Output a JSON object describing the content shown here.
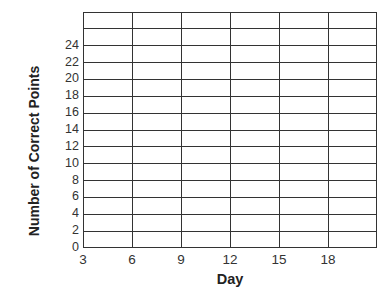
{
  "chart_data": {
    "type": "line",
    "title": "",
    "xlabel": "Day",
    "ylabel": "Number of Correct Points",
    "x_ticks": [
      "3",
      "6",
      "9",
      "12",
      "15",
      "18"
    ],
    "y_ticks": [
      "0",
      "2",
      "4",
      "6",
      "8",
      "10",
      "12",
      "14",
      "16",
      "18",
      "20",
      "22",
      "24"
    ],
    "xlim": [
      3,
      21
    ],
    "ylim": [
      0,
      28
    ],
    "grid": true,
    "legend": null,
    "series": [],
    "note": "Blank grid with no plotted data points"
  },
  "layout": {
    "plot_left": 83,
    "plot_top": 12,
    "plot_right": 377,
    "plot_bottom": 248,
    "columns": 6,
    "rows": 14
  }
}
